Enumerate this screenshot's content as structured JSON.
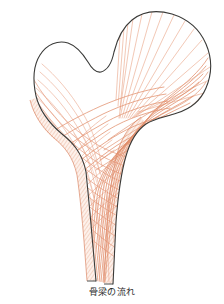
{
  "figure": {
    "caption": "骨梁の流れ",
    "colors": {
      "background": "#ffffff",
      "outline": "#3a3a38",
      "trabecular_line": "#e08a66",
      "trabecular_line_light": "#eeb39a",
      "cortical_hatch": "#e6a184",
      "cortical_fill": "#fdf1ec",
      "caption_text": "#2b2b2b"
    },
    "regions": [
      {
        "name": "femoral-head",
        "label": ""
      },
      {
        "name": "greater-trochanter",
        "label": ""
      },
      {
        "name": "femoral-neck",
        "label": ""
      },
      {
        "name": "lesser-trochanter",
        "label": ""
      },
      {
        "name": "femoral-shaft",
        "label": ""
      },
      {
        "name": "lateral-cortex",
        "label": ""
      },
      {
        "name": "medial-cortex-calcar",
        "label": ""
      }
    ],
    "trabecular_groups": [
      {
        "name": "principal-compressive-group",
        "count": 16
      },
      {
        "name": "principal-tensile-group",
        "count": 12
      },
      {
        "name": "greater-trochanteric-group",
        "count": 9
      },
      {
        "name": "secondary-compressive-group",
        "count": 10
      },
      {
        "name": "secondary-tensile-group",
        "count": 8
      }
    ]
  }
}
